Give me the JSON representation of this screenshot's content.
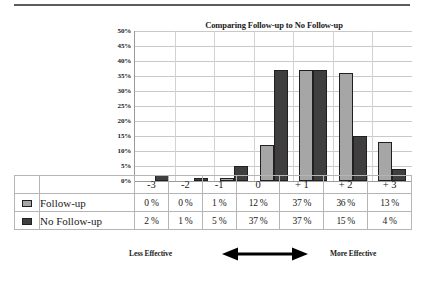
{
  "chart_data": {
    "type": "bar",
    "title": "Comparing Follow-up to No Follow-up",
    "xlabel": "",
    "ylabel": "",
    "ylim": [
      0,
      50
    ],
    "ytick_labels": [
      "50%",
      "45%",
      "40%",
      "35%",
      "30%",
      "25%",
      "20%",
      "15%",
      "10%",
      "5%",
      "0%"
    ],
    "ytick_values": [
      50,
      45,
      40,
      35,
      30,
      25,
      20,
      15,
      10,
      5,
      0
    ],
    "grid": true,
    "legend_position": "table-below",
    "categories": [
      "-3",
      "-2",
      "-1",
      "0",
      "+ 1",
      "+ 2",
      "+ 3"
    ],
    "series": [
      {
        "name": "Follow-up",
        "color": "#a6a6a6",
        "values": [
          0,
          0,
          1,
          12,
          37,
          36,
          13
        ],
        "labels": [
          "0 %",
          "0 %",
          "1 %",
          "12 %",
          "37 %",
          "36 %",
          "13 %"
        ]
      },
      {
        "name": "No Follow-up",
        "color": "#3f3f3f",
        "values": [
          2,
          1,
          5,
          37,
          37,
          15,
          4
        ],
        "labels": [
          "2 %",
          "1 %",
          "5 %",
          "37 %",
          "37 %",
          "15 %",
          "4 %"
        ]
      }
    ],
    "annotations": {
      "left_label": "Less Effective",
      "right_label": "More Effective",
      "arrow": "double-headed-horizontal-arrow"
    }
  }
}
